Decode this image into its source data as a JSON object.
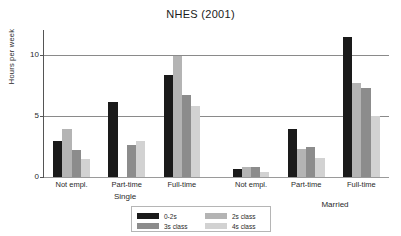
{
  "chart_data": {
    "type": "bar",
    "title": "NHES (2001)",
    "xlabel": "",
    "ylabel": "Hours per week",
    "ylim": [
      0,
      12
    ],
    "yticks": [
      0,
      5,
      10
    ],
    "ytick_labels": [
      "0",
      "5",
      "10"
    ],
    "grid": "horizontal",
    "legend_position": "bottom-center",
    "categories": [
      "Not empl.",
      "Part-time",
      "Full-time",
      "Not empl.",
      "Part-time",
      "Full-time"
    ],
    "group_labels": [
      "Single",
      "Married"
    ],
    "groups": [
      {
        "name": "Single",
        "categories": [
          "Not empl.",
          "Part-time",
          "Full-time"
        ]
      },
      {
        "name": "Married",
        "categories": [
          "Not empl.",
          "Part-time",
          "Full-time"
        ]
      }
    ],
    "series": [
      {
        "name": "0-2s",
        "color": "#1a1a1a",
        "values": [
          2.9,
          6.1,
          8.3,
          0.65,
          3.9,
          11.4
        ]
      },
      {
        "name": "2s class",
        "color": "#b4b4b4",
        "values": [
          3.9,
          0.0,
          9.9,
          0.8,
          2.25,
          7.7
        ]
      },
      {
        "name": "3s class",
        "color": "#8c8c8c",
        "values": [
          2.2,
          2.6,
          6.7,
          0.8,
          2.45,
          7.3
        ]
      },
      {
        "name": "4s class",
        "color": "#d2d2d2",
        "values": [
          1.45,
          2.9,
          5.8,
          0.45,
          1.55,
          5.0
        ]
      }
    ],
    "legend": [
      {
        "label": "0-2s",
        "color": "#1a1a1a"
      },
      {
        "label": "3s class",
        "color": "#8c8c8c"
      },
      {
        "label": "2s class",
        "color": "#b4b4b4"
      },
      {
        "label": "4s class",
        "color": "#d2d2d2"
      }
    ]
  }
}
